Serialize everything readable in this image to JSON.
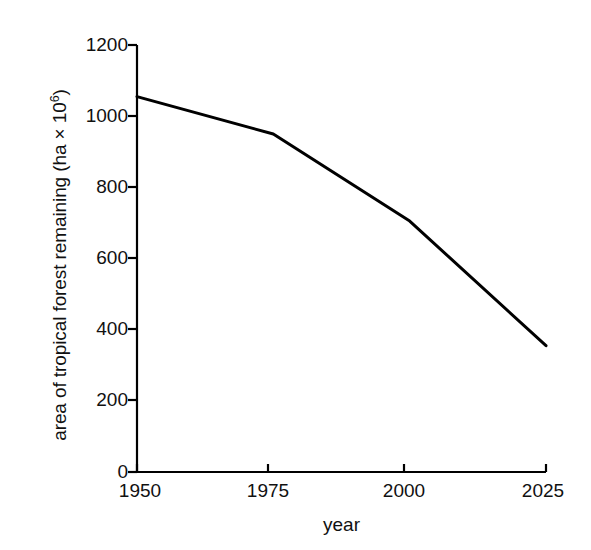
{
  "chart_data": {
    "type": "line",
    "title": "",
    "subtitle": "",
    "xlabel": "year",
    "ylabel": "area of tropical forest remaining (ha × 10⁶)",
    "ylabel_parts": {
      "main": "area of tropical forest remaining (ha × 10",
      "exponent": "6",
      "tail": ")"
    },
    "x": [
      1950,
      1975,
      2000,
      2025
    ],
    "values": [
      1055,
      950,
      705,
      355
    ],
    "series": [
      {
        "name": "area of tropical forest remaining",
        "values": [
          1055,
          950,
          705,
          355
        ]
      }
    ],
    "xlim": [
      1950,
      2025
    ],
    "ylim": [
      0,
      1200
    ],
    "xticks": [
      1950,
      1975,
      2000,
      2025
    ],
    "xtick_labels": [
      "1950",
      "1975",
      "2000",
      "2025"
    ],
    "yticks": [
      0,
      200,
      400,
      600,
      800,
      1000,
      1200
    ],
    "ytick_labels": [
      "0",
      "200",
      "400",
      "600",
      "800",
      "1000",
      "1200"
    ],
    "grid": false,
    "legend": false,
    "legend_position": "none",
    "line_color": "#000000",
    "line_width": 3,
    "axis_color": "#000000",
    "background_color": "#ffffff",
    "markers": false,
    "annotations": []
  }
}
